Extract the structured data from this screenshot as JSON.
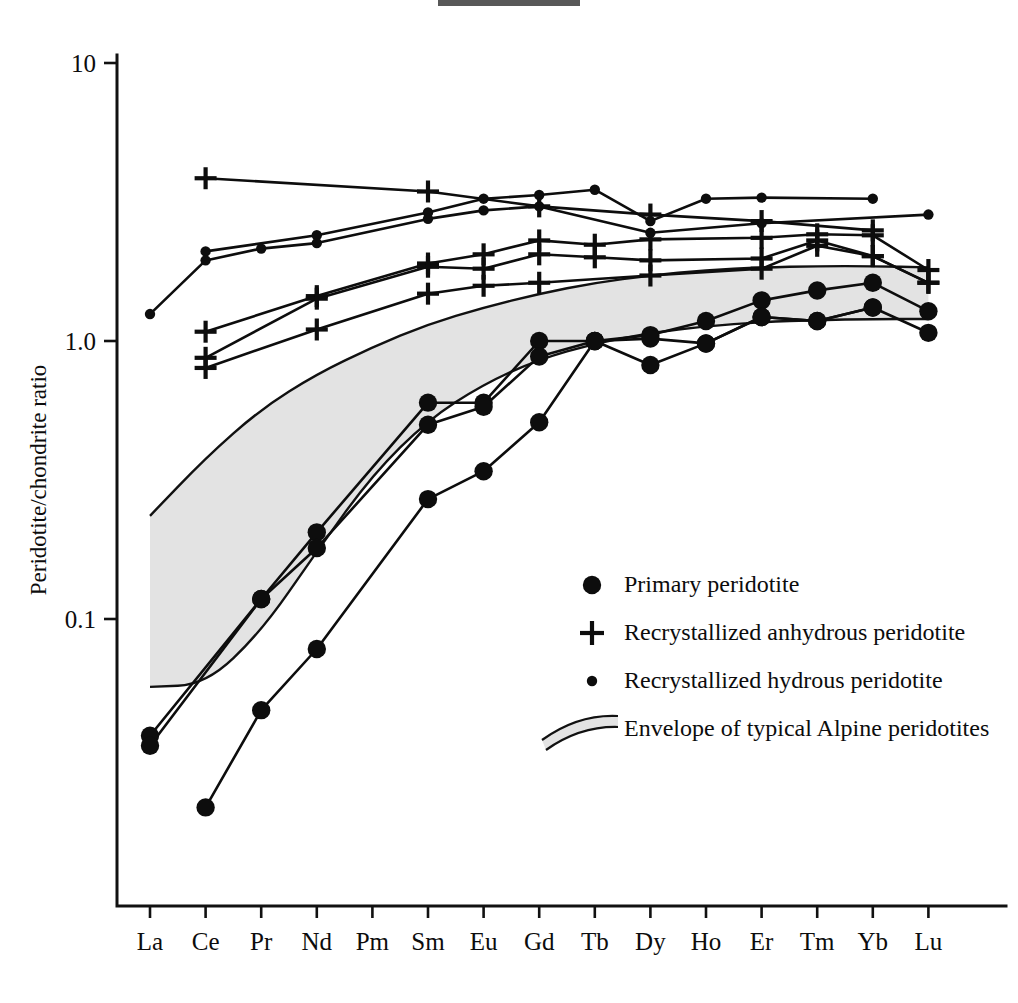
{
  "figure": {
    "artifact_name": "scan-artifact-bar"
  },
  "axes": {
    "y_title": "Peridotite/chondrite ratio",
    "y_ticks": [
      "10",
      "1.0",
      "0.1"
    ],
    "x_ticks": [
      "La",
      "Ce",
      "Pr",
      "Nd",
      "Pm",
      "Sm",
      "Eu",
      "Gd",
      "Tb",
      "Dy",
      "Ho",
      "Er",
      "Tm",
      "Yb",
      "Lu"
    ]
  },
  "legend": {
    "items": [
      {
        "marker": "large-filled-circle",
        "label": "Primary peridotite"
      },
      {
        "marker": "plus-cross",
        "label": "Recrystallized anhydrous peridotite"
      },
      {
        "marker": "small-filled-circle",
        "label": "Recrystallized hydrous peridotite"
      },
      {
        "marker": "shaded-band",
        "label": "Envelope of typical Alpine peridotites"
      }
    ]
  },
  "chart_data": {
    "type": "line",
    "title": "",
    "xlabel": "",
    "ylabel": "Peridotite/chondrite ratio",
    "yscale": "log",
    "ylim": [
      0.012,
      10
    ],
    "grid": false,
    "legend_position": "inside-lower-right",
    "categories": [
      "La",
      "Ce",
      "Pr",
      "Nd",
      "Pm",
      "Sm",
      "Eu",
      "Gd",
      "Tb",
      "Dy",
      "Ho",
      "Er",
      "Tm",
      "Yb",
      "Lu"
    ],
    "groups": [
      {
        "name": "Primary peridotite",
        "marker": "large-filled-circle",
        "series": [
          {
            "name": "primary-1",
            "x": [
              "La",
              "Pr",
              "Nd",
              "Sm",
              "Eu",
              "Gd",
              "Tb",
              "Dy",
              "Ho",
              "Er",
              "Tm",
              "Yb",
              "Lu"
            ],
            "values": [
              0.038,
              0.118,
              0.205,
              0.6,
              0.6,
              1.0,
              1.0,
              1.05,
              1.18,
              1.4,
              1.52,
              1.62,
              1.28
            ]
          },
          {
            "name": "primary-2",
            "x": [
              "La",
              "Pr",
              "Nd",
              "Sm",
              "Eu",
              "Gd",
              "Tb",
              "Dy",
              "Ho",
              "Er",
              "Tm",
              "Yb",
              "Lu"
            ],
            "values": [
              0.035,
              0.118,
              0.18,
              0.5,
              0.58,
              0.88,
              1.0,
              1.02,
              0.98,
              1.22,
              1.18,
              1.32,
              1.07
            ]
          },
          {
            "name": "primary-3",
            "x": [
              "Ce",
              "Pr",
              "Nd",
              "Sm",
              "Eu",
              "Gd",
              "Tb",
              "Dy",
              "Ho",
              "Er",
              "Tm",
              "Yb"
            ],
            "values": [
              0.021,
              0.047,
              0.078,
              0.27,
              0.34,
              0.51,
              1.0,
              0.82,
              0.98,
              1.22,
              1.18,
              1.32
            ]
          }
        ]
      },
      {
        "name": "Recrystallized anhydrous peridotite",
        "marker": "plus-cross",
        "series": [
          {
            "name": "anhydrous-1",
            "x": [
              "Ce",
              "Sm",
              "Gd",
              "Dy",
              "Er",
              "Yb"
            ],
            "values": [
              3.85,
              3.45,
              3.05,
              2.85,
              2.7,
              2.5
            ]
          },
          {
            "name": "anhydrous-2",
            "x": [
              "Ce",
              "Nd",
              "Sm",
              "Eu",
              "Gd",
              "Tb",
              "Dy",
              "Er",
              "Tm",
              "Yb",
              "Lu"
            ],
            "values": [
              1.08,
              1.45,
              1.9,
              2.05,
              2.3,
              2.22,
              2.32,
              2.35,
              2.42,
              2.4,
              1.8
            ]
          },
          {
            "name": "anhydrous-3",
            "x": [
              "Ce",
              "Nd",
              "Sm",
              "Eu",
              "Gd",
              "Tb",
              "Dy",
              "Er",
              "Tm",
              "Yb",
              "Lu"
            ],
            "values": [
              0.87,
              1.42,
              1.85,
              1.82,
              2.05,
              2.0,
              1.95,
              1.98,
              2.3,
              2.02,
              1.62
            ]
          },
          {
            "name": "anhydrous-4",
            "x": [
              "Ce",
              "Nd",
              "Sm",
              "Eu",
              "Gd",
              "Dy",
              "Er",
              "Tm",
              "Yb",
              "Lu"
            ],
            "values": [
              0.8,
              1.1,
              1.48,
              1.58,
              1.62,
              1.72,
              1.82,
              2.2,
              2.02,
              1.62
            ]
          }
        ]
      },
      {
        "name": "Recrystallized hydrous peridotite",
        "marker": "small-filled-circle",
        "series": [
          {
            "name": "hydrous-1",
            "x": [
              "Ce",
              "Nd",
              "Sm",
              "Eu",
              "Gd",
              "Tb",
              "Dy",
              "Ho",
              "Er",
              "Yb"
            ],
            "values": [
              2.1,
              2.4,
              2.9,
              3.25,
              3.35,
              3.5,
              2.7,
              3.25,
              3.28,
              3.25
            ]
          },
          {
            "name": "hydrous-2",
            "x": [
              "La",
              "Ce",
              "Pr",
              "Nd",
              "Sm",
              "Eu",
              "Gd",
              "Dy",
              "Er",
              "Lu"
            ],
            "values": [
              1.25,
              1.95,
              2.15,
              2.25,
              2.75,
              2.95,
              3.05,
              2.45,
              2.65,
              2.85
            ]
          }
        ]
      }
    ],
    "envelope": {
      "name": "Envelope of typical Alpine peridotites",
      "upper": {
        "x": [
          "La",
          "Ce",
          "Pr",
          "Nd",
          "Pm",
          "Sm",
          "Eu",
          "Gd",
          "Tb",
          "Dy",
          "Ho",
          "Er",
          "Tm",
          "Yb",
          "Lu"
        ],
        "values": [
          0.235,
          0.38,
          0.57,
          0.76,
          0.95,
          1.15,
          1.32,
          1.48,
          1.62,
          1.72,
          1.8,
          1.84,
          1.86,
          1.86,
          1.84
        ]
      },
      "lower": {
        "x": [
          "La",
          "Ce",
          "Pr",
          "Nd",
          "Pm",
          "Sm",
          "Eu",
          "Gd",
          "Tb",
          "Dy",
          "Ho",
          "Er",
          "Tm",
          "Yb",
          "Lu"
        ],
        "values": [
          0.057,
          0.058,
          0.09,
          0.175,
          0.33,
          0.52,
          0.7,
          0.86,
          0.98,
          1.07,
          1.13,
          1.17,
          1.19,
          1.2,
          1.2
        ]
      }
    }
  }
}
